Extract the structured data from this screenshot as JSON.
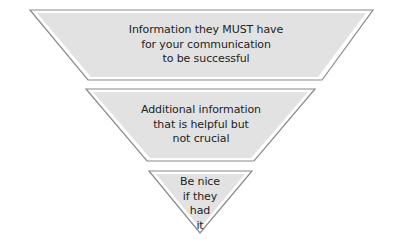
{
  "diagram": {
    "type": "inverted-pyramid",
    "colors": {
      "fill": "#e2e2e2",
      "outline": "#8a8a8a",
      "inner_gap": "#ffffff",
      "text": "#222222"
    },
    "tiers": [
      {
        "level": 1,
        "lines": [
          "Information they MUST have",
          "for your communication",
          "to be successful"
        ]
      },
      {
        "level": 2,
        "lines": [
          "Additional information",
          "that is helpful but",
          "not crucial"
        ]
      },
      {
        "level": 3,
        "lines": [
          "Be nice",
          "if they",
          "had",
          "it"
        ]
      }
    ]
  }
}
